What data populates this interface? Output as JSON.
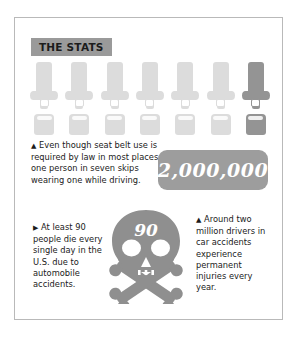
{
  "header": {
    "badge_label": "THE STATS"
  },
  "colors": {
    "frame_border": "#b9b9b9",
    "badge_bg": "#9a9a9a",
    "icon_light": "#dcdcdc",
    "icon_dark": "#949494",
    "callout_bg": "#9d9d9d",
    "skull_fill": "#8f8f8f",
    "text": "#1b1b1b",
    "page_bg": "#ffffff"
  },
  "buckle_row": {
    "icon_name": "seat-belt-buckle-icon",
    "total": 7,
    "highlighted_index": 7,
    "items": [
      {
        "tone": "#dcdcdc",
        "state": "buckled"
      },
      {
        "tone": "#dcdcdc",
        "state": "buckled"
      },
      {
        "tone": "#dcdcdc",
        "state": "buckled"
      },
      {
        "tone": "#dcdcdc",
        "state": "buckled"
      },
      {
        "tone": "#dcdcdc",
        "state": "buckled"
      },
      {
        "tone": "#dcdcdc",
        "state": "buckled"
      },
      {
        "tone": "#949494",
        "state": "unbuckled"
      }
    ]
  },
  "stats": {
    "seatbelt_law": {
      "bullet": "▲",
      "text": "Even though seat belt use is required by law in most places, one person in seven skips wearing one while driving."
    },
    "daily_deaths": {
      "bullet": "▶",
      "text": "At least 90 people die every single day in the U.S. due to automobile accidents."
    },
    "injuries": {
      "bullet": "▲",
      "text": "Around two million drivers in car accidents experience permanent injuries every year."
    }
  },
  "callout": {
    "value": "2,000,000"
  },
  "skull": {
    "icon_name": "skull-and-crossbones-icon",
    "number": "90"
  }
}
